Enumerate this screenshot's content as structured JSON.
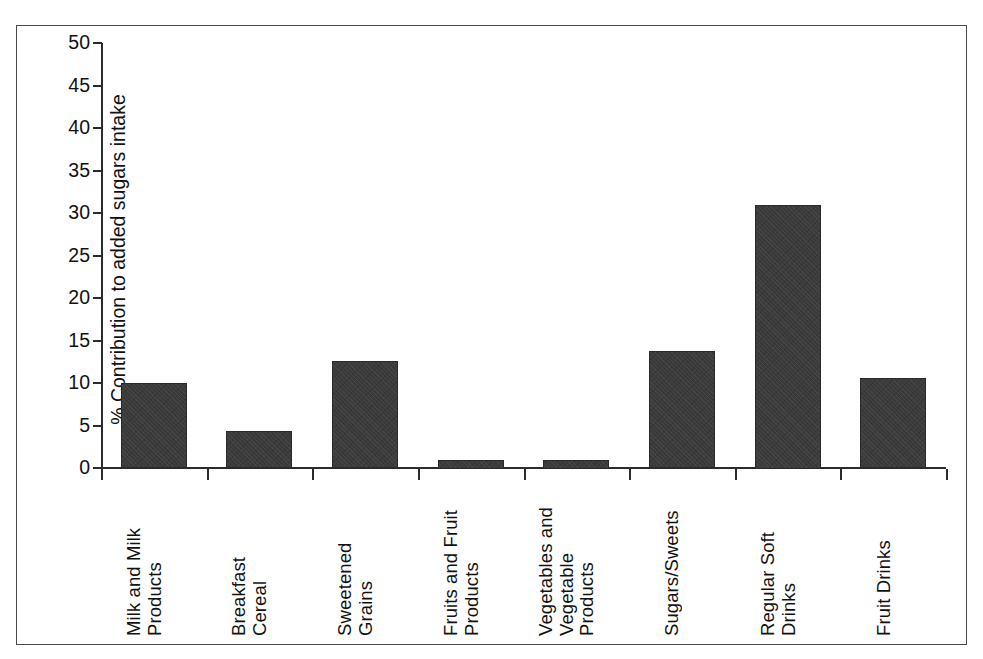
{
  "chart_data": {
    "type": "bar",
    "title": "",
    "xlabel": "",
    "ylabel": "% Contribution to added sugars intake",
    "ylim": [
      0,
      50
    ],
    "ytick_interval": 5,
    "yticks": [
      0,
      5,
      10,
      15,
      20,
      25,
      30,
      35,
      40,
      45,
      50
    ],
    "grid": false,
    "legend": "none",
    "categories": [
      "Milk and Milk\nProducts",
      "Breakfast\nCereal",
      "Sweetened\nGrains",
      "Fruits and Fruit\nProducts",
      "Vegetables and\nVegetable\nProducts",
      "Sugars/Sweets",
      "Regular Soft\nDrinks",
      "Fruit Drinks"
    ],
    "values": [
      10.0,
      4.3,
      12.6,
      1.0,
      1.0,
      13.8,
      31.0,
      10.6
    ],
    "bar_color": "#3b3b3b",
    "axis_color": "#2b2b2b",
    "background_color": "#ffffff"
  }
}
